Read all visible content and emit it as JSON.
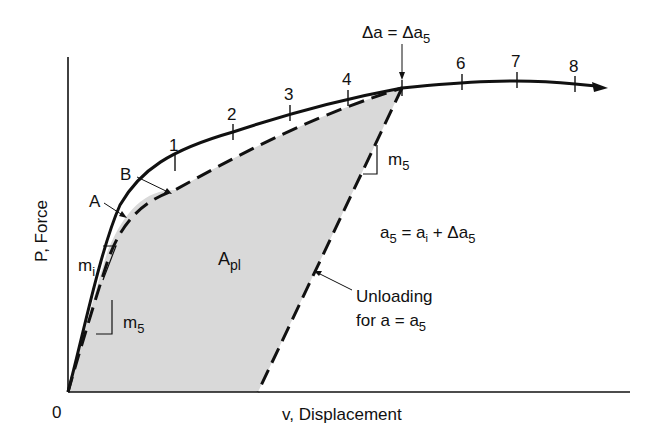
{
  "diagram": {
    "axes": {
      "x_label": "v, Displacement",
      "y_label": "P, Force",
      "origin_label": "0"
    },
    "curve_labels": {
      "A": "A",
      "B": "B"
    },
    "tick_labels": [
      "1",
      "2",
      "3",
      "4",
      "6",
      "7",
      "8"
    ],
    "annotations": {
      "delta_a": {
        "main": "Δa = Δa",
        "sub": "5"
      },
      "area": {
        "main": "A",
        "sub": "pl"
      },
      "slope_initial": {
        "main": "m",
        "sub": "i"
      },
      "slope_5_lower": {
        "main": "m",
        "sub": "5"
      },
      "slope_5_upper": {
        "main": "m",
        "sub": "5"
      },
      "equation": {
        "a5": "a",
        "a5_sub": "5",
        "eq": " = a",
        "ai_sub": "i",
        "plus": " + Δa",
        "delta_sub": "5"
      },
      "unloading": {
        "line1": "Unloading",
        "line2": "for a = a",
        "line2_sub": "5"
      }
    },
    "colors": {
      "line": "#111111",
      "fill": "#d9d9d9",
      "background": "#ffffff"
    }
  }
}
